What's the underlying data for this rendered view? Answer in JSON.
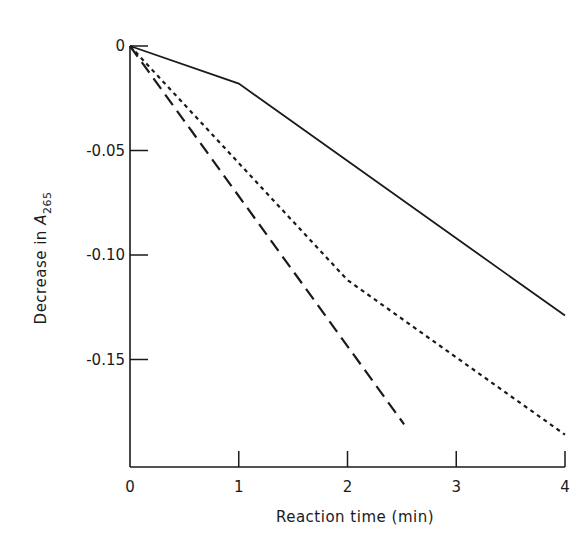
{
  "chart_data": {
    "type": "line",
    "title": "",
    "xlabel": "Reaction time (min)",
    "ylabel": "Decrease in A265",
    "ylabel_parts": {
      "prefix": "Decrease in ",
      "symbol": "A",
      "subscript": "265"
    },
    "xlim": [
      0,
      4
    ],
    "ylim": [
      -0.2,
      0
    ],
    "x_ticks": [
      0,
      1,
      2,
      3,
      4
    ],
    "x_tick_labels": [
      "0",
      "1",
      "2",
      "3",
      "4"
    ],
    "y_ticks": [
      0,
      -0.05,
      -0.1,
      -0.15
    ],
    "y_tick_labels": [
      "0",
      "-0.05",
      "-0.10",
      "-0.15"
    ],
    "grid": false,
    "legend": null,
    "series": [
      {
        "name": "solid",
        "style": "solid",
        "points": [
          [
            0,
            0
          ],
          [
            1.0,
            -0.018
          ],
          [
            4,
            -0.129
          ]
        ]
      },
      {
        "name": "dotted",
        "style": "dotted",
        "points": [
          [
            0,
            0
          ],
          [
            2,
            -0.112
          ],
          [
            4,
            -0.186
          ]
        ]
      },
      {
        "name": "dashed",
        "style": "dashed",
        "points": [
          [
            0,
            0
          ],
          [
            2.52,
            -0.181
          ]
        ]
      }
    ]
  },
  "colors": {
    "line": "#1a1a1a",
    "background": "#ffffff"
  }
}
